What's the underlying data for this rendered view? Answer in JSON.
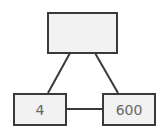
{
  "diagram": {
    "nodes": [
      {
        "id": "top",
        "label": ""
      },
      {
        "id": "left",
        "label": "4"
      },
      {
        "id": "right",
        "label": "600"
      }
    ],
    "edges": [
      {
        "from": "top",
        "to": "left"
      },
      {
        "from": "top",
        "to": "right"
      },
      {
        "from": "left",
        "to": "right"
      }
    ],
    "colors": {
      "node_fill": "#f2f2f2",
      "stroke": "#3a3a3a",
      "text": "#666666"
    }
  }
}
